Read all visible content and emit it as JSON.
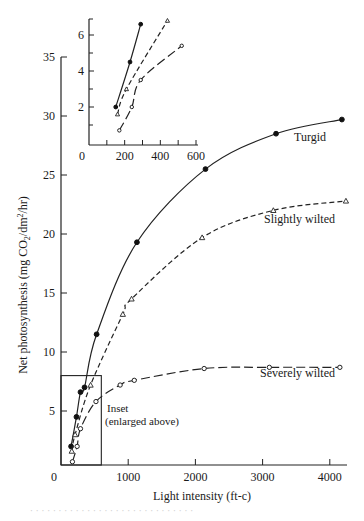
{
  "chart_data": {
    "type": "line",
    "title": "",
    "xlabel": "Light intensity (ft-c)",
    "ylabel": "Net photosynthesis (mg CO₂/dm²/hr)",
    "xlim": [
      0,
      4300
    ],
    "ylim": [
      0,
      35
    ],
    "x_ticks": [
      0,
      1000,
      2000,
      3000,
      4000
    ],
    "y_ticks": [
      5,
      10,
      15,
      20,
      25,
      30,
      35
    ],
    "y_tick_labels_shown": [
      "5",
      "10",
      "15",
      "20",
      "25",
      "30",
      "35"
    ],
    "x_origin_label": "0",
    "grid": false,
    "legend": "inline curve labels",
    "series": [
      {
        "name": "Turgid",
        "marker": "filled-circle",
        "line": "solid",
        "points": [
          [
            150,
            2.0
          ],
          [
            230,
            4.5
          ],
          [
            290,
            6.6
          ],
          [
            350,
            7.0
          ],
          [
            530,
            11.5
          ],
          [
            1130,
            19.3
          ],
          [
            2150,
            25.5
          ],
          [
            3200,
            28.5
          ],
          [
            4180,
            29.7
          ]
        ]
      },
      {
        "name": "Slightly wilted",
        "marker": "open-triangle",
        "line": "dashed",
        "points": [
          [
            160,
            1.6
          ],
          [
            210,
            3.0
          ],
          [
            440,
            7.2
          ],
          [
            920,
            13.2
          ],
          [
            1050,
            14.5
          ],
          [
            2100,
            19.7
          ],
          [
            3160,
            22.0
          ],
          [
            4240,
            22.8
          ]
        ]
      },
      {
        "name": "Severely wilted",
        "marker": "open-circle",
        "line": "long-dashed",
        "points": [
          [
            170,
            0.7
          ],
          [
            240,
            2.0
          ],
          [
            290,
            3.5
          ],
          [
            520,
            5.8
          ],
          [
            880,
            7.2
          ],
          [
            1090,
            7.6
          ],
          [
            2130,
            8.6
          ],
          [
            3100,
            8.7
          ],
          [
            4150,
            8.7
          ]
        ]
      }
    ],
    "annotations": [
      {
        "text": "Inset",
        "x": 700,
        "y": 5.0
      },
      {
        "text": "(enlarged above)",
        "x": 700,
        "y": 3.6
      },
      {
        "text": "inset-region-box",
        "x_range": [
          0,
          600
        ],
        "y_range": [
          0,
          8
        ]
      }
    ],
    "inset": {
      "type": "line",
      "xlim": [
        0,
        600
      ],
      "ylim": [
        0,
        7
      ],
      "x_ticks": [
        0,
        200,
        400,
        600
      ],
      "x_minor_ticks": [
        100,
        300,
        500
      ],
      "y_ticks": [
        2,
        4,
        6
      ],
      "y_minor_ticks": [
        1,
        3,
        5
      ],
      "series": [
        {
          "name": "Turgid",
          "marker": "filled-circle",
          "line": "solid",
          "points": [
            [
              150,
              2.0
            ],
            [
              230,
              4.5
            ],
            [
              290,
              6.6
            ]
          ]
        },
        {
          "name": "Slightly wilted",
          "marker": "open-triangle",
          "line": "dashed",
          "points": [
            [
              160,
              1.6
            ],
            [
              210,
              3.0
            ],
            [
              440,
              6.8
            ]
          ]
        },
        {
          "name": "Severely wilted",
          "marker": "open-circle",
          "line": "long-dashed",
          "points": [
            [
              170,
              0.7
            ],
            [
              240,
              2.0
            ],
            [
              290,
              3.5
            ],
            [
              520,
              5.4
            ]
          ]
        }
      ]
    }
  },
  "labels": {
    "xlabel": "Light intensity (ft-c)",
    "ylabel_main": "Net photosynthesis (mg CO",
    "ylabel_sub2": "2",
    "ylabel_mid": "/dm",
    "ylabel_sup2": "2",
    "ylabel_end": "/hr)",
    "turgid": "Turgid",
    "slightly_wilted": "Slightly wilted",
    "severely_wilted": "Severely wilted",
    "inset_line1": "Inset",
    "inset_line2": "(enlarged above)"
  },
  "caption": "· · · · · · · · · · · · · · · · · · · · · · · · · · · · ·"
}
